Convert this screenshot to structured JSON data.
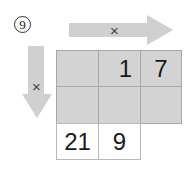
{
  "badge": {
    "number": "9"
  },
  "arrows": {
    "horizontal": {
      "symbol": "×",
      "direction": "right",
      "color": "#d0d0d0"
    },
    "vertical": {
      "symbol": "×",
      "direction": "down",
      "color": "#d0d0d0"
    }
  },
  "grid": {
    "rows": [
      [
        "",
        "1",
        "7"
      ],
      [
        "",
        "",
        ""
      ],
      [
        "21",
        "9",
        null
      ]
    ],
    "shaded_color": "#d3d3d3"
  }
}
